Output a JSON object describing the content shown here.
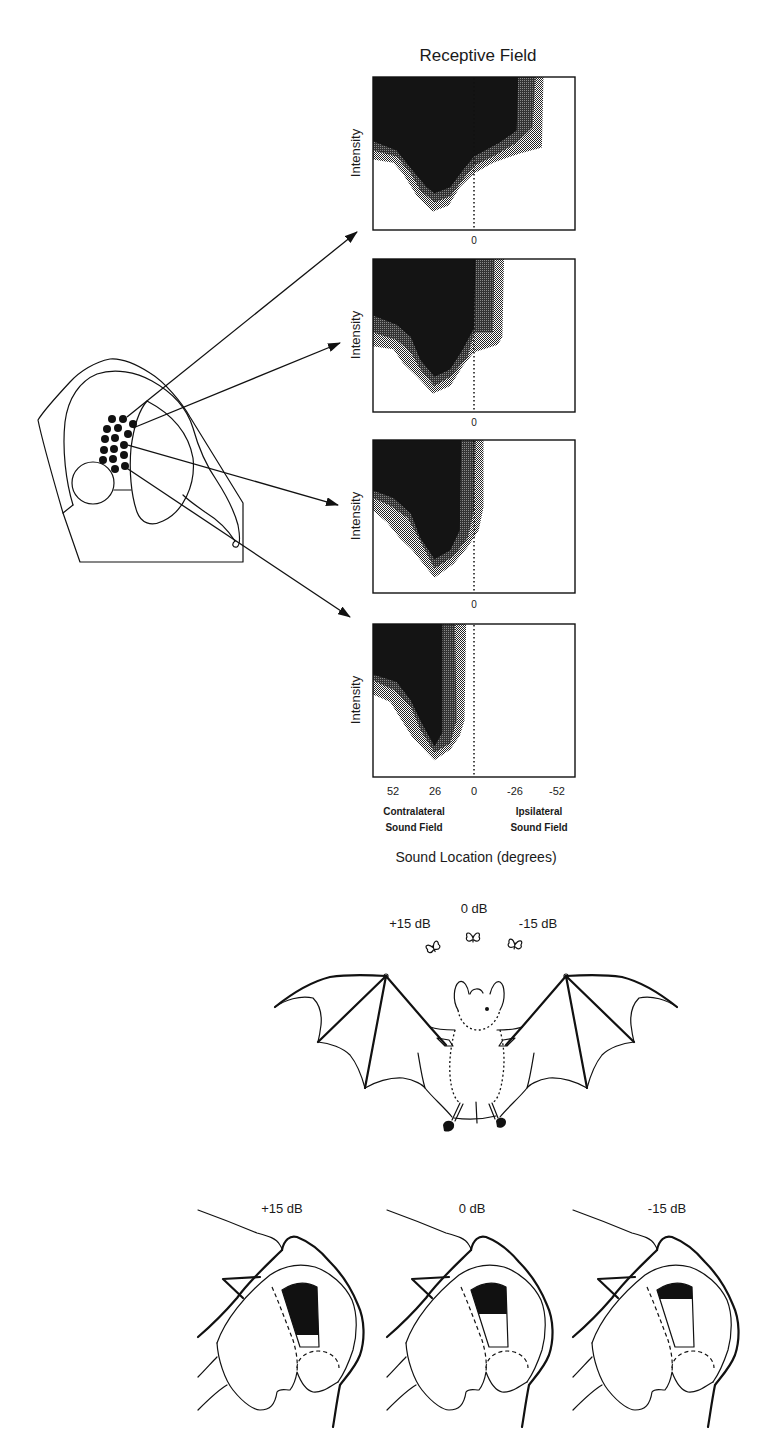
{
  "figure": {
    "title": "Receptive Field",
    "y_axis_label": "Intensity",
    "zero_label": "0",
    "x_ticks": [
      "52",
      "26",
      "0",
      "-26",
      "-52"
    ],
    "contralateral_label": [
      "Contralateral",
      "Sound Field"
    ],
    "ipsilateral_label": [
      "Ipsilateral",
      "Sound Field"
    ],
    "x_axis_title": "Sound Location (degrees)"
  },
  "bat_scene": {
    "targets": [
      {
        "label": "+15 dB"
      },
      {
        "label": "0 dB"
      },
      {
        "label": "-15 dB"
      }
    ]
  },
  "sections": [
    {
      "label": "+15 dB",
      "active_fraction": 0.8
    },
    {
      "label": "0 dB",
      "active_fraction": 0.45
    },
    {
      "label": "-15 dB",
      "active_fraction": 0.2
    }
  ],
  "colors": {
    "core": "#141414",
    "middle": "#4a4a4a",
    "outer_stipple": "#9a9a9a",
    "ink": "#111111"
  },
  "chart_data": {
    "type": "heatmap",
    "title": "Receptive Field",
    "xlabel": "Sound Location (degrees)",
    "ylabel": "Intensity",
    "x_ticks": [
      52,
      26,
      0,
      -26,
      -52
    ],
    "xlim": [
      64,
      -64
    ],
    "ylim": [
      0,
      1
    ],
    "x_region_labels": [
      "Contralateral Sound Field",
      "Ipsilateral Sound Field"
    ],
    "reference_line": {
      "x": 0,
      "style": "dotted"
    },
    "grid": false,
    "band_levels": [
      "outer",
      "middle",
      "core"
    ],
    "panels": [
      {
        "name": "panel-1",
        "bands": [
          {
            "level": "outer",
            "points": [
              [
                64,
                0.46
              ],
              [
                51,
                0.44
              ],
              [
                45,
                0.37
              ],
              [
                36,
                0.22
              ],
              [
                26,
                0.12
              ],
              [
                16,
                0.16
              ],
              [
                9,
                0.28
              ],
              [
                0,
                0.37
              ],
              [
                -12,
                0.44
              ],
              [
                -29,
                0.5
              ],
              [
                -43,
                0.54
              ],
              [
                -44,
                1.0
              ]
            ]
          },
          {
            "level": "middle",
            "points": [
              [
                64,
                0.52
              ],
              [
                49,
                0.48
              ],
              [
                40,
                0.37
              ],
              [
                34,
                0.26
              ],
              [
                25,
                0.18
              ],
              [
                15,
                0.22
              ],
              [
                7,
                0.33
              ],
              [
                0,
                0.42
              ],
              [
                -12,
                0.48
              ],
              [
                -27,
                0.57
              ],
              [
                -37,
                0.67
              ],
              [
                -39,
                1.0
              ]
            ]
          },
          {
            "level": "core",
            "points": [
              [
                64,
                0.58
              ],
              [
                49,
                0.52
              ],
              [
                39,
                0.39
              ],
              [
                30,
                0.28
              ],
              [
                25,
                0.24
              ],
              [
                15,
                0.28
              ],
              [
                7,
                0.39
              ],
              [
                0,
                0.48
              ],
              [
                -16,
                0.57
              ],
              [
                -27,
                0.65
              ],
              [
                -28,
                1.0
              ]
            ]
          }
        ]
      },
      {
        "name": "panel-2",
        "bands": [
          {
            "level": "outer",
            "points": [
              [
                64,
                0.43
              ],
              [
                51,
                0.41
              ],
              [
                45,
                0.32
              ],
              [
                36,
                0.23
              ],
              [
                26,
                0.12
              ],
              [
                15,
                0.17
              ],
              [
                7,
                0.3
              ],
              [
                0,
                0.39
              ],
              [
                -15,
                0.44
              ],
              [
                -18,
                0.49
              ],
              [
                -19,
                1.0
              ]
            ]
          },
          {
            "level": "middle",
            "points": [
              [
                64,
                0.52
              ],
              [
                49,
                0.47
              ],
              [
                40,
                0.39
              ],
              [
                34,
                0.28
              ],
              [
                25,
                0.17
              ],
              [
                15,
                0.23
              ],
              [
                4,
                0.36
              ],
              [
                0,
                0.52
              ],
              [
                -12,
                0.52
              ],
              [
                -13,
                1.0
              ]
            ]
          },
          {
            "level": "core",
            "points": [
              [
                64,
                0.63
              ],
              [
                49,
                0.57
              ],
              [
                40,
                0.49
              ],
              [
                34,
                0.34
              ],
              [
                25,
                0.23
              ],
              [
                15,
                0.28
              ],
              [
                7,
                0.41
              ],
              [
                0,
                0.55
              ],
              [
                -1,
                1.0
              ]
            ]
          }
        ]
      },
      {
        "name": "panel-3",
        "bands": [
          {
            "level": "outer",
            "points": [
              [
                64,
                0.54
              ],
              [
                55,
                0.46
              ],
              [
                47,
                0.36
              ],
              [
                39,
                0.28
              ],
              [
                25,
                0.1
              ],
              [
                13,
                0.19
              ],
              [
                4,
                0.3
              ],
              [
                -3,
                0.41
              ],
              [
                -6,
                0.56
              ],
              [
                -6,
                1.0
              ]
            ]
          },
          {
            "level": "middle",
            "points": [
              [
                64,
                0.62
              ],
              [
                53,
                0.57
              ],
              [
                42,
                0.49
              ],
              [
                34,
                0.34
              ],
              [
                25,
                0.16
              ],
              [
                13,
                0.24
              ],
              [
                4,
                0.36
              ],
              [
                0,
                0.54
              ],
              [
                -1,
                1.0
              ]
            ]
          },
          {
            "level": "core",
            "points": [
              [
                64,
                0.67
              ],
              [
                51,
                0.62
              ],
              [
                40,
                0.52
              ],
              [
                34,
                0.36
              ],
              [
                25,
                0.22
              ],
              [
                15,
                0.28
              ],
              [
                9,
                0.41
              ],
              [
                8,
                1.0
              ]
            ]
          }
        ]
      },
      {
        "name": "panel-4",
        "bands": [
          {
            "level": "outer",
            "points": [
              [
                64,
                0.54
              ],
              [
                53,
                0.49
              ],
              [
                47,
                0.39
              ],
              [
                39,
                0.26
              ],
              [
                25,
                0.11
              ],
              [
                15,
                0.18
              ],
              [
                9,
                0.27
              ],
              [
                6,
                0.37
              ],
              [
                5,
                1.0
              ]
            ]
          },
          {
            "level": "middle",
            "points": [
              [
                64,
                0.63
              ],
              [
                51,
                0.57
              ],
              [
                40,
                0.46
              ],
              [
                34,
                0.31
              ],
              [
                25,
                0.16
              ],
              [
                15,
                0.22
              ],
              [
                11,
                0.37
              ],
              [
                12,
                1.0
              ]
            ]
          },
          {
            "level": "core",
            "points": [
              [
                64,
                0.67
              ],
              [
                49,
                0.62
              ],
              [
                40,
                0.5
              ],
              [
                34,
                0.37
              ],
              [
                25,
                0.2
              ],
              [
                20,
                0.29
              ],
              [
                20,
                1.0
              ]
            ]
          }
        ]
      }
    ]
  }
}
